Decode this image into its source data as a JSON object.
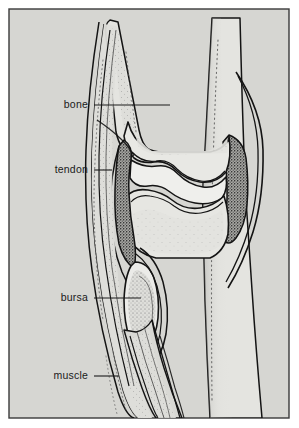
{
  "figure": {
    "kind": "anatomical-illustration",
    "view": "longitudinal section",
    "background_color": "#d6d6d2",
    "page_color": "#ffffff",
    "frame_color": "#3a3a3a",
    "ink_color": "#141414",
    "bone_fill": "#e4e4e0",
    "tendon_fill": "#dedeDA",
    "synovium_fill": "#8e8e8a",
    "cavity_fill": "#ececeA",
    "muscle_fill": "#d2d2ce"
  },
  "labels": [
    {
      "id": "bone",
      "text": "bone",
      "text_anchor_x": 88,
      "text_y": 108,
      "leader_x1": 94,
      "leader_x2": 170,
      "leader_y": 105
    },
    {
      "id": "tendon",
      "text": "tendon",
      "text_anchor_x": 88,
      "text_y": 173,
      "leader_x1": 94,
      "leader_x2": 112,
      "leader_y": 170
    },
    {
      "id": "bursa",
      "text": "bursa",
      "text_anchor_x": 88,
      "text_y": 301,
      "leader_x1": 94,
      "leader_x2": 141,
      "leader_y": 298
    },
    {
      "id": "muscle",
      "text": "muscle",
      "text_anchor_x": 88,
      "text_y": 379,
      "leader_x1": 94,
      "leader_x2": 119,
      "leader_y": 376
    }
  ],
  "structures": [
    {
      "id": "upper-bone-shaft",
      "name": "upper bone shaft"
    },
    {
      "id": "upper-bone-condyle",
      "name": "upper bone condyle"
    },
    {
      "id": "lower-bone-shaft",
      "name": "lower bone shaft"
    },
    {
      "id": "lower-bone-head",
      "name": "lower bone head"
    },
    {
      "id": "joint-cavity",
      "name": "joint cavity"
    },
    {
      "id": "synovial-membrane",
      "name": "synovial membrane"
    },
    {
      "id": "joint-capsule",
      "name": "joint capsule"
    },
    {
      "id": "tendon-sheath",
      "name": "tendon sheath"
    },
    {
      "id": "bursa-sac",
      "name": "bursa sac"
    },
    {
      "id": "muscle-belly",
      "name": "muscle belly"
    }
  ]
}
